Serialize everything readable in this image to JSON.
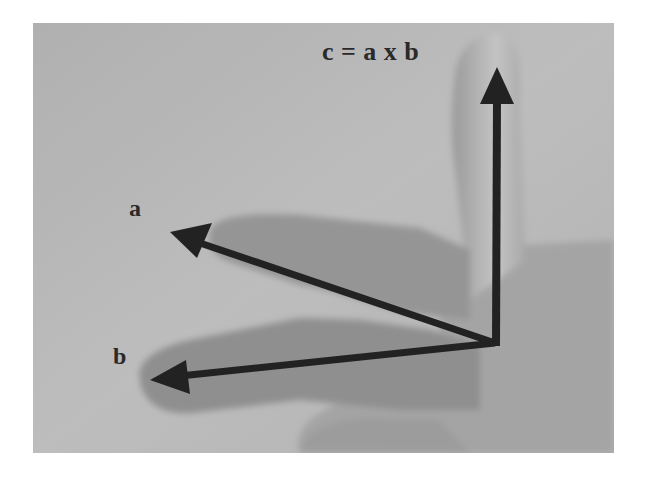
{
  "figure": {
    "labels": {
      "c": "c = a x b",
      "a": "a",
      "b": "b"
    },
    "vectors": [
      {
        "name": "a",
        "from": [
          495,
          343
        ],
        "to": [
          170,
          232
        ]
      },
      {
        "name": "b",
        "from": [
          495,
          343
        ],
        "to": [
          150,
          380
        ]
      },
      {
        "name": "c",
        "from": [
          495,
          343
        ],
        "to": [
          497,
          67
        ]
      }
    ],
    "colors": {
      "background": "#b3b3b3",
      "hand_shadow": "#8f8f8f",
      "arrow": "#222222",
      "label": "#2a2a2a"
    }
  }
}
